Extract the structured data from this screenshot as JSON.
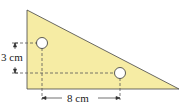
{
  "diagram": {
    "shape": "right-triangle",
    "fill_color": "#f6eca4",
    "stroke_color": "#333333",
    "holes": [
      {
        "name": "upper-hole",
        "cx": 42,
        "cy": 43,
        "r": 5.5
      },
      {
        "name": "lower-hole",
        "cx": 120,
        "cy": 73,
        "r": 5.5
      }
    ],
    "dimensions": {
      "vertical": {
        "label": "3 cm"
      },
      "horizontal": {
        "label": "8 cm"
      }
    }
  }
}
